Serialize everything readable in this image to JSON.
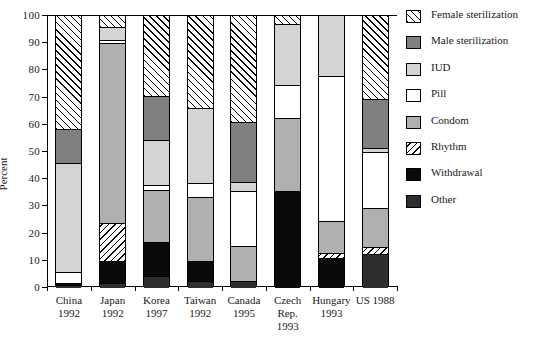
{
  "chart_data": {
    "type": "bar",
    "title": "",
    "subtitle": "",
    "xlabel": "",
    "ylabel": "Percent",
    "ylim": [
      0,
      100
    ],
    "yticks": [
      0,
      10,
      20,
      30,
      40,
      50,
      60,
      70,
      80,
      90,
      100
    ],
    "grid": false,
    "stacked": true,
    "legend_position": "right",
    "categories": [
      "China\n1992",
      "Japan\n1992",
      "Korea\n1997",
      "Taiwan\n1992",
      "Canada\n1995",
      "Czech Rep.\n1993",
      "Hungary\n1993",
      "US 1988"
    ],
    "category_lines": [
      [
        "China",
        "1992"
      ],
      [
        "Japan",
        "1992"
      ],
      [
        "Korea",
        "1997"
      ],
      [
        "Taiwan",
        "1992"
      ],
      [
        "Canada",
        "1995"
      ],
      [
        "Czech",
        "Rep.",
        "1993"
      ],
      [
        "Hungary",
        "1993"
      ],
      [
        "US 1988"
      ]
    ],
    "series": [
      {
        "name": "Female sterilization",
        "pattern": "diagonal-hatch-up",
        "color": "#ffffff",
        "values": [
          41.5,
          4.0,
          29.5,
          34.0,
          39.0,
          3.0,
          0.0,
          30.5
        ]
      },
      {
        "name": "Male sterilization",
        "pattern": "solid",
        "color": "#808080",
        "values": [
          12.5,
          0.0,
          16.0,
          0.0,
          22.0,
          0.0,
          0.0,
          18.0
        ]
      },
      {
        "name": "IUD",
        "pattern": "solid",
        "color": "#d4d4d4",
        "values": [
          40.0,
          5.0,
          16.5,
          27.5,
          3.5,
          22.5,
          22.0,
          1.5
        ]
      },
      {
        "name": "Pill",
        "pattern": "solid",
        "color": "#ffffff",
        "values": [
          4.0,
          1.0,
          2.0,
          5.0,
          20.0,
          12.0,
          53.5,
          20.5
        ]
      },
      {
        "name": "Condom",
        "pattern": "solid",
        "color": "#b0b0b0",
        "values": [
          0.0,
          66.0,
          19.0,
          23.5,
          13.0,
          27.0,
          11.5,
          14.5
        ]
      },
      {
        "name": "Rhythm",
        "pattern": "diagonal-hatch-down",
        "color": "#ffffff",
        "values": [
          0.0,
          14.0,
          0.0,
          0.0,
          0.0,
          0.0,
          2.0,
          2.5
        ]
      },
      {
        "name": "Withdrawal",
        "pattern": "solid",
        "color": "#0a0a0a",
        "values": [
          1.0,
          8.0,
          12.5,
          7.5,
          0.0,
          35.5,
          11.0,
          0.0
        ]
      },
      {
        "name": "Other",
        "pattern": "solid",
        "color": "#2e2e2e",
        "values": [
          1.0,
          2.0,
          4.5,
          2.5,
          2.5,
          0.0,
          0.0,
          12.5
        ]
      }
    ]
  },
  "legend": {
    "items": [
      {
        "label": "Female sterilization",
        "swatch_class": "f-female"
      },
      {
        "label": "Male sterilization",
        "swatch_class": "f-male"
      },
      {
        "label": "IUD",
        "swatch_class": "f-iud"
      },
      {
        "label": "Pill",
        "swatch_class": "f-pill"
      },
      {
        "label": "Condom",
        "swatch_class": "f-condom"
      },
      {
        "label": "Rhythm",
        "swatch_class": "f-rhythm"
      },
      {
        "label": "Withdrawal",
        "swatch_class": "f-withdrawal"
      },
      {
        "label": "Other",
        "swatch_class": "f-other"
      }
    ]
  },
  "series_fill_classes": [
    "f-female",
    "f-male",
    "f-iud",
    "f-pill",
    "f-condom",
    "f-rhythm",
    "f-withdrawal",
    "f-other"
  ]
}
